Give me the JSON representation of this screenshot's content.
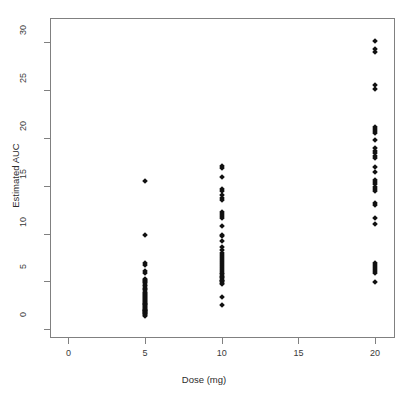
{
  "chart_data": {
    "type": "scatter",
    "title": "",
    "xlabel": "Dose (mg)",
    "ylabel": "Estimated AUC",
    "xlim": [
      -1.2,
      21.3
    ],
    "ylim": [
      -0.9,
      32.5
    ],
    "xticks": [
      0,
      5,
      10,
      15,
      20
    ],
    "xtick_labels": [
      "0",
      "5",
      "10",
      "15",
      "20"
    ],
    "yticks": [
      0,
      5,
      10,
      15,
      20,
      25,
      30
    ],
    "ytick_labels": [
      "0",
      "5",
      "10",
      "15",
      "20",
      "25",
      "30"
    ],
    "grid": false,
    "legend": false,
    "marker": "diamond",
    "marker_color": "#111111",
    "box": true,
    "series": [
      {
        "name": "Estimated AUC by Dose",
        "x": [
          5,
          5,
          5,
          5,
          5,
          5,
          5,
          5,
          5,
          5,
          5,
          5,
          5,
          5,
          5,
          5,
          5,
          5,
          5,
          5,
          5,
          5,
          5,
          5,
          5,
          5,
          5,
          5,
          5,
          5,
          5,
          5,
          5,
          5,
          5,
          5,
          5,
          5,
          5,
          5,
          5,
          5,
          5,
          5,
          5,
          10,
          10,
          10,
          10,
          10,
          10,
          10,
          10,
          10,
          10,
          10,
          10,
          10,
          10,
          10,
          10,
          10,
          10,
          10,
          10,
          10,
          10,
          10,
          10,
          10,
          10,
          10,
          10,
          10,
          10,
          10,
          10,
          10,
          10,
          10,
          10,
          10,
          10,
          10,
          10,
          20,
          20,
          20,
          20,
          20,
          20,
          20,
          20,
          20,
          20,
          20,
          20,
          20,
          20,
          20,
          20,
          20,
          20,
          20,
          20,
          20,
          20,
          20,
          20,
          20,
          20,
          20,
          20,
          20,
          20,
          20,
          20,
          20,
          20
        ],
        "y": [
          15.5,
          9.8,
          6.9,
          6.7,
          6.1,
          5.9,
          5.3,
          5.2,
          5.1,
          4.9,
          4.8,
          4.6,
          4.5,
          4.3,
          4.2,
          4.1,
          3.9,
          3.8,
          3.7,
          3.6,
          3.5,
          3.4,
          3.3,
          3.2,
          3.1,
          3.0,
          2.9,
          2.8,
          2.7,
          2.6,
          2.5,
          2.4,
          2.3,
          2.2,
          2.1,
          2.05,
          2.0,
          1.95,
          1.9,
          1.8,
          1.75,
          1.7,
          1.6,
          1.5,
          1.4,
          17.1,
          16.8,
          15.9,
          14.6,
          14.4,
          14.0,
          13.7,
          13.5,
          12.2,
          12.0,
          11.8,
          11.6,
          10.8,
          9.9,
          9.7,
          9.2,
          8.6,
          8.3,
          8.0,
          7.8,
          7.6,
          7.3,
          7.1,
          6.9,
          6.7,
          6.5,
          6.3,
          6.1,
          5.9,
          5.8,
          5.6,
          5.5,
          5.4,
          5.2,
          5.1,
          5.0,
          4.8,
          4.7,
          3.4,
          2.5,
          30.1,
          29.3,
          29.0,
          25.5,
          25.1,
          21.1,
          20.9,
          20.7,
          19.8,
          18.6,
          18.4,
          18.1,
          17.9,
          16.9,
          15.6,
          15.4,
          15.2,
          14.6,
          14.4,
          13.2,
          11.6,
          11.0,
          6.9,
          6.7,
          6.5,
          6.3,
          6.1,
          5.9,
          4.9,
          20.5,
          18.9,
          14.9,
          16.4,
          13.0
        ]
      }
    ]
  },
  "figure": {
    "background_color": "#ffffff",
    "axis_color": "#808080",
    "text_color": "#2b2b2b"
  }
}
